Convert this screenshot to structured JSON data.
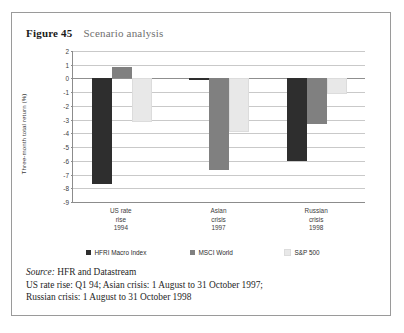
{
  "figure": {
    "number": "Figure 45",
    "caption": "Scenario analysis"
  },
  "footnotes": {
    "source_label": "Source:",
    "source_text": " HFR and Datastream",
    "note_line_1": "US rate rise: Q1 94; Asian crisis: 1 August to 31 October 1997;",
    "note_line_2": "Russian crisis: 1 August to 31 October 1998"
  },
  "chart_data": {
    "type": "bar",
    "title": "Scenario analysis",
    "xlabel": "",
    "ylabel": "Three-month total return (%)",
    "ylim": [
      -9,
      2
    ],
    "yticks": [
      2,
      1,
      0,
      -1,
      -2,
      -3,
      -4,
      -5,
      -6,
      -7,
      -8,
      -9
    ],
    "ytick_labels": [
      "2",
      "1",
      "0",
      "-1",
      "-2",
      "-3",
      "-4",
      "-5",
      "-6",
      "-7",
      "-8",
      "-9"
    ],
    "grid": true,
    "legend_position": "bottom",
    "categories": [
      "US rate rise 1994",
      "Asian crisis 1997",
      "Russian crisis 1998"
    ],
    "category_lines": [
      [
        "US rate",
        "rise",
        "1994"
      ],
      [
        "Asian",
        "crisis",
        "1997"
      ],
      [
        "Russian",
        "crisis",
        "1998"
      ]
    ],
    "series": [
      {
        "name": "HFRI Macro Index",
        "color": "#2e2e2e",
        "values": [
          -7.7,
          -0.1,
          -6.0
        ]
      },
      {
        "name": "MSCI World",
        "color": "#808080",
        "values": [
          0.8,
          -6.7,
          -3.3
        ]
      },
      {
        "name": "S&P 500",
        "color": "#e8e8e8",
        "values": [
          -3.2,
          -3.9,
          -1.1
        ]
      }
    ]
  },
  "colors": {
    "frame_border": "#9a9a9a",
    "gridline": "#c9c9c9",
    "axis": "#8c8c8c",
    "caption_text": "#6f6f6f",
    "body_text": "#1f1f1f"
  }
}
